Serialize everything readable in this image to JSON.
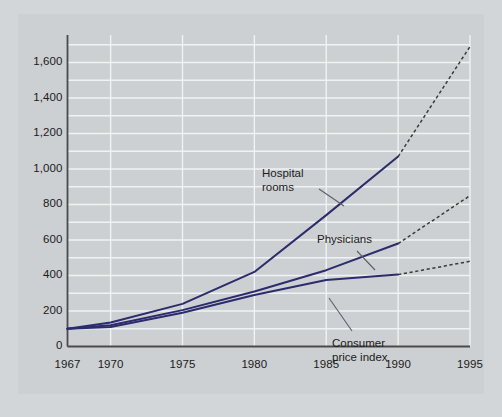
{
  "chart_data": {
    "type": "line",
    "title": "",
    "subtitle": "",
    "xlabel": "",
    "ylabel": "",
    "xlim": [
      1967,
      1995
    ],
    "ylim": [
      0,
      1700
    ],
    "grid": true,
    "grid_minor_step": 100,
    "legend_position": "inline-annotations",
    "y_ticks": [
      0,
      200,
      400,
      600,
      800,
      1000,
      1200,
      1400,
      1600
    ],
    "y_tick_labels": [
      "0",
      "200",
      "400",
      "600",
      "800",
      "1,000",
      "1,200",
      "1,400",
      "1,600"
    ],
    "x_ticks": [
      1967,
      1970,
      1975,
      1980,
      1985,
      1990,
      1995
    ],
    "x_tick_labels": [
      "1967",
      "1970",
      "1975",
      "1980",
      "1985",
      "1990",
      "1995"
    ],
    "line_color": "#2b2b6e",
    "projection_color": "#3a3a3a",
    "projection_start_year": 1990,
    "series": [
      {
        "name": "Hospital rooms",
        "label": "Hospital rooms",
        "label_lines": [
          "Hospital",
          "rooms"
        ],
        "x": [
          1967,
          1970,
          1975,
          1980,
          1985,
          1990
        ],
        "values": [
          100,
          135,
          240,
          420,
          740,
          1070
        ],
        "projection_x": [
          1990,
          1995
        ],
        "projection_values": [
          1070,
          1690
        ]
      },
      {
        "name": "Physicians",
        "label": "Physicians",
        "label_lines": [
          "Physicians"
        ],
        "x": [
          1967,
          1970,
          1975,
          1980,
          1985,
          1990
        ],
        "values": [
          100,
          120,
          205,
          310,
          430,
          580
        ],
        "projection_x": [
          1990,
          1995
        ],
        "projection_values": [
          580,
          850
        ]
      },
      {
        "name": "Consumer price index",
        "label": "Consumer price index",
        "label_lines": [
          "Consumer",
          "price index"
        ],
        "x": [
          1967,
          1970,
          1975,
          1980,
          1985,
          1990
        ],
        "values": [
          100,
          110,
          190,
          290,
          375,
          405
        ],
        "projection_x": [
          1990,
          1995
        ],
        "projection_values": [
          405,
          480
        ]
      }
    ],
    "annotations": [
      {
        "text": "Hospital rooms",
        "for": "Hospital rooms"
      },
      {
        "text": "Physicians",
        "for": "Physicians"
      },
      {
        "text": "Consumer price index",
        "for": "Consumer price index"
      }
    ]
  },
  "colors": {
    "background": "#c9cccf",
    "plate": "#cdd0d2",
    "gridline": "#f0f2f3",
    "axis": "#4a4a4a",
    "series": "#2b2b6e",
    "projection": "#3a3a3a",
    "text": "#1b1b1b"
  }
}
